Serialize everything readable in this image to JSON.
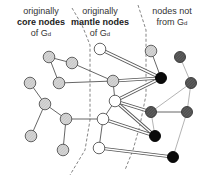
{
  "labels": {
    "core": {
      "line1": "originally",
      "line2": "core nodes",
      "line3": "of G",
      "sub": "d"
    },
    "mantle": {
      "line1": "originally",
      "line2": "mantle nodes",
      "line3": "of G",
      "sub": "d"
    },
    "outside": {
      "line1": "nodes not",
      "line2": "from G",
      "sub": "d"
    }
  },
  "colors": {
    "core_fill": "#cfcfcf",
    "mantle_fill": "#ffffff",
    "mid_fill": "#dcdcdc",
    "black_fill": "#0a0a0a",
    "dark_fill": "#555555",
    "edge": "#555555",
    "dashed": "#666666"
  },
  "nodes": [
    {
      "id": "c1",
      "x": 49,
      "y": 57,
      "type": "core"
    },
    {
      "id": "c2",
      "x": 72,
      "y": 63,
      "type": "core"
    },
    {
      "id": "c3",
      "x": 59,
      "y": 83,
      "type": "core"
    },
    {
      "id": "c4",
      "x": 30,
      "y": 83,
      "type": "core"
    },
    {
      "id": "c5",
      "x": 45,
      "y": 104,
      "type": "core"
    },
    {
      "id": "c6",
      "x": 66,
      "y": 119,
      "type": "core"
    },
    {
      "id": "c7",
      "x": 31,
      "y": 136,
      "type": "core"
    },
    {
      "id": "c8",
      "x": 63,
      "y": 150,
      "type": "core"
    },
    {
      "id": "m1",
      "x": 100,
      "y": 49,
      "type": "mantle"
    },
    {
      "id": "m2",
      "x": 113,
      "y": 81,
      "type": "mid"
    },
    {
      "id": "m3",
      "x": 115,
      "y": 101,
      "type": "mantle"
    },
    {
      "id": "m4",
      "x": 103,
      "y": 119,
      "type": "mantle"
    },
    {
      "id": "m5",
      "x": 99,
      "y": 148,
      "type": "mantle"
    },
    {
      "id": "o1",
      "x": 151,
      "y": 51,
      "type": "mid"
    },
    {
      "id": "o2",
      "x": 161,
      "y": 78,
      "type": "black"
    },
    {
      "id": "o3",
      "x": 180,
      "y": 57,
      "type": "dark"
    },
    {
      "id": "o4",
      "x": 191,
      "y": 83,
      "type": "dark"
    },
    {
      "id": "o5",
      "x": 151,
      "y": 112,
      "type": "dark"
    },
    {
      "id": "o6",
      "x": 187,
      "y": 112,
      "type": "dark"
    },
    {
      "id": "o7",
      "x": 155,
      "y": 136,
      "type": "black"
    },
    {
      "id": "o8",
      "x": 173,
      "y": 157,
      "type": "black"
    }
  ],
  "edges": [
    {
      "a": "c1",
      "b": "c2",
      "style": "single"
    },
    {
      "a": "c1",
      "b": "c3",
      "style": "single"
    },
    {
      "a": "c2",
      "b": "m2",
      "style": "single"
    },
    {
      "a": "c3",
      "b": "m2",
      "style": "single"
    },
    {
      "a": "c4",
      "b": "c5",
      "style": "single"
    },
    {
      "a": "c5",
      "b": "c6",
      "style": "single"
    },
    {
      "a": "c5",
      "b": "c7",
      "style": "single"
    },
    {
      "a": "c6",
      "b": "c8",
      "style": "single"
    },
    {
      "a": "c6",
      "b": "m4",
      "style": "single"
    },
    {
      "a": "m2",
      "b": "m3",
      "style": "single"
    },
    {
      "a": "m3",
      "b": "m4",
      "style": "single"
    },
    {
      "a": "m4",
      "b": "m5",
      "style": "single"
    },
    {
      "a": "m1",
      "b": "o2",
      "style": "double"
    },
    {
      "a": "m2",
      "b": "o2",
      "style": "double"
    },
    {
      "a": "m3",
      "b": "o2",
      "style": "double"
    },
    {
      "a": "m3",
      "b": "o5",
      "style": "double"
    },
    {
      "a": "m3",
      "b": "o7",
      "style": "double"
    },
    {
      "a": "m4",
      "b": "o7",
      "style": "double"
    },
    {
      "a": "m5",
      "b": "o8",
      "style": "double"
    },
    {
      "a": "o1",
      "b": "o2",
      "style": "single"
    },
    {
      "a": "o3",
      "b": "o4",
      "style": "light"
    },
    {
      "a": "o4",
      "b": "o5",
      "style": "light"
    },
    {
      "a": "o4",
      "b": "o6",
      "style": "light"
    },
    {
      "a": "o5",
      "b": "o6",
      "style": "single"
    },
    {
      "a": "o5",
      "b": "o7",
      "style": "light"
    },
    {
      "a": "o6",
      "b": "o8",
      "style": "light"
    }
  ],
  "dividers": [
    {
      "points": [
        [
          72,
          8
        ],
        [
          82,
          25
        ],
        [
          90,
          45
        ],
        [
          90,
          120
        ],
        [
          85,
          150
        ],
        [
          70,
          175
        ]
      ]
    },
    {
      "points": [
        [
          138,
          5
        ],
        [
          146,
          30
        ],
        [
          146,
          70
        ],
        [
          146,
          95
        ],
        [
          140,
          125
        ],
        [
          133,
          150
        ],
        [
          125,
          170
        ]
      ]
    }
  ]
}
